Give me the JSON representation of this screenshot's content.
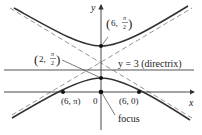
{
  "diagram": {
    "type": "hyperbola (polar conic)",
    "axes": {
      "x_label": "x",
      "y_label": "y"
    },
    "directrix": {
      "label": "y = 3 (directrix)"
    },
    "points": [
      {
        "id": "top-vertex",
        "label_main": "6, ",
        "label_frac_num": "π",
        "label_frac_den": "2"
      },
      {
        "id": "bottom-vertex",
        "label_main": "2, ",
        "label_frac_num": "π",
        "label_frac_den": "2"
      },
      {
        "id": "left-x-intercept",
        "label": "(6, π)"
      },
      {
        "id": "right-x-intercept",
        "label": "(6, 0)"
      },
      {
        "id": "origin",
        "label": "0"
      }
    ],
    "focus_label": "focus",
    "colors": {
      "curve": "#333333",
      "asymptote": "#888888",
      "axis": "#333333"
    }
  }
}
